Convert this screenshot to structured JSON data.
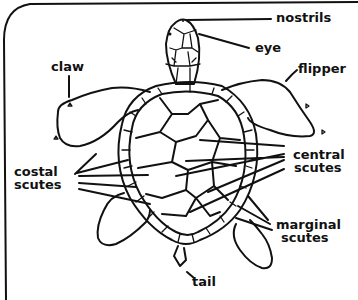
{
  "diagram": {
    "labels": {
      "nostrils": "nostrils",
      "eye": "eye",
      "claw": "claw",
      "flipper": "flipper",
      "costal_line1": "costal",
      "costal_line2": "scutes",
      "central_line1": "central",
      "central_line2": "scutes",
      "marginal_line1": "marginal",
      "marginal_line2": "scutes",
      "tail": "tail"
    },
    "colors": {
      "ink": "#111111",
      "background": "#ffffff"
    }
  }
}
